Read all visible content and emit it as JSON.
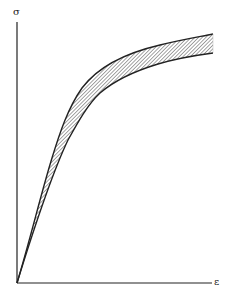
{
  "diagram": {
    "type": "stress-strain-envelope",
    "y_axis_label": "σ",
    "x_axis_label": "ε",
    "colors": {
      "line": "#222222",
      "hatch": "#333333",
      "background": "#ffffff"
    },
    "band": {
      "fill": "diagonal-hatch",
      "upper_curve": "upper stress-strain bound",
      "lower_curve": "lower stress-strain bound"
    }
  }
}
